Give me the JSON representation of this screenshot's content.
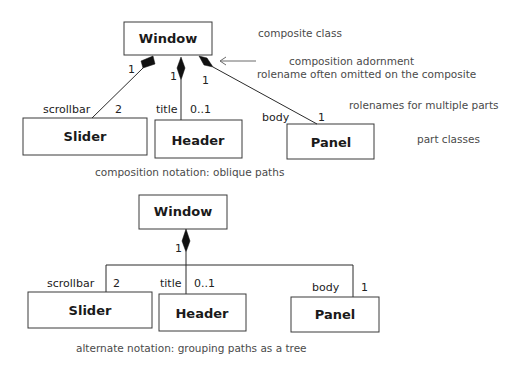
{
  "top_diagram": {
    "caption": "composition notation: oblique paths",
    "composite": {
      "name": "Window"
    },
    "parts": [
      {
        "name": "Slider",
        "rolename": "scrollbar",
        "multiplicity": "2",
        "composite_multiplicity": "1"
      },
      {
        "name": "Header",
        "rolename": "title",
        "multiplicity": "0..1",
        "composite_multiplicity": "1"
      },
      {
        "name": "Panel",
        "rolename": "body",
        "multiplicity": "1",
        "composite_multiplicity": "1"
      }
    ],
    "annotations": {
      "composite_class": "composite class",
      "composition_adornment": "composition adornment",
      "rolename_omitted": "rolename often omitted on the composite",
      "rolenames_multiple": "rolenames for multiple parts",
      "part_classes": "part classes"
    }
  },
  "bottom_diagram": {
    "caption": "alternate notation: grouping paths as a tree",
    "composite": {
      "name": "Window",
      "multiplicity": "1"
    },
    "parts": [
      {
        "name": "Slider",
        "rolename": "scrollbar",
        "multiplicity": "2"
      },
      {
        "name": "Header",
        "rolename": "title",
        "multiplicity": "0..1"
      },
      {
        "name": "Panel",
        "rolename": "body",
        "multiplicity": "1"
      }
    ]
  }
}
